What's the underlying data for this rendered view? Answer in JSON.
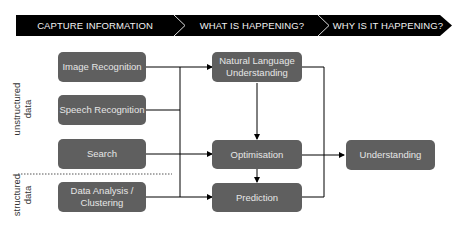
{
  "header": {
    "stages": [
      {
        "label": "CAPTURE INFORMATION"
      },
      {
        "label": "WHAT IS HAPPENING?"
      },
      {
        "label": "WHY IS IT HAPPENING?"
      }
    ],
    "color": "#000000"
  },
  "side_labels": {
    "unstructured": "unstructured\ndata",
    "unstructured_line1": "unstructured",
    "unstructured_line2": "data",
    "structured_line1": "structured",
    "structured_line2": "data"
  },
  "inputs": [
    {
      "label": "Image Recognition"
    },
    {
      "label": "Speech Recognition"
    },
    {
      "label": "Search"
    },
    {
      "label": "Data Analysis / Clustering",
      "line1": "Data Analysis /",
      "line2": "Clustering"
    }
  ],
  "processes": [
    {
      "label": "Natural Language Understanding",
      "line1": "Natural Language",
      "line2": "Understanding"
    },
    {
      "label": "Optimisation"
    },
    {
      "label": "Prediction"
    }
  ],
  "output": {
    "label": "Understanding"
  },
  "colors": {
    "box": "#5f5f5f",
    "box_text": "#e6e6e6",
    "line": "#000000"
  }
}
